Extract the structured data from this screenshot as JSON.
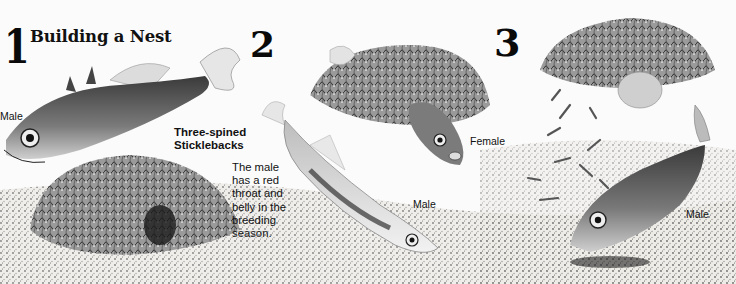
{
  "illustration": {
    "title": "Building a Nest",
    "panels": [
      {
        "number": "1",
        "labels": [
          "Male"
        ]
      },
      {
        "number": "2",
        "labels": [
          "Female",
          "Male"
        ]
      },
      {
        "number": "3",
        "labels": [
          "Male"
        ]
      }
    ],
    "species_heading": [
      "Three-spined",
      "Sticklebacks"
    ],
    "caption_lines": [
      "The male",
      "has a red",
      "throat and",
      "belly in the",
      "breeding",
      "season."
    ],
    "labels": {
      "panel1_male": "Male",
      "panel2_female": "Female",
      "panel2_male": "Male",
      "panel3_male": "Male"
    }
  }
}
